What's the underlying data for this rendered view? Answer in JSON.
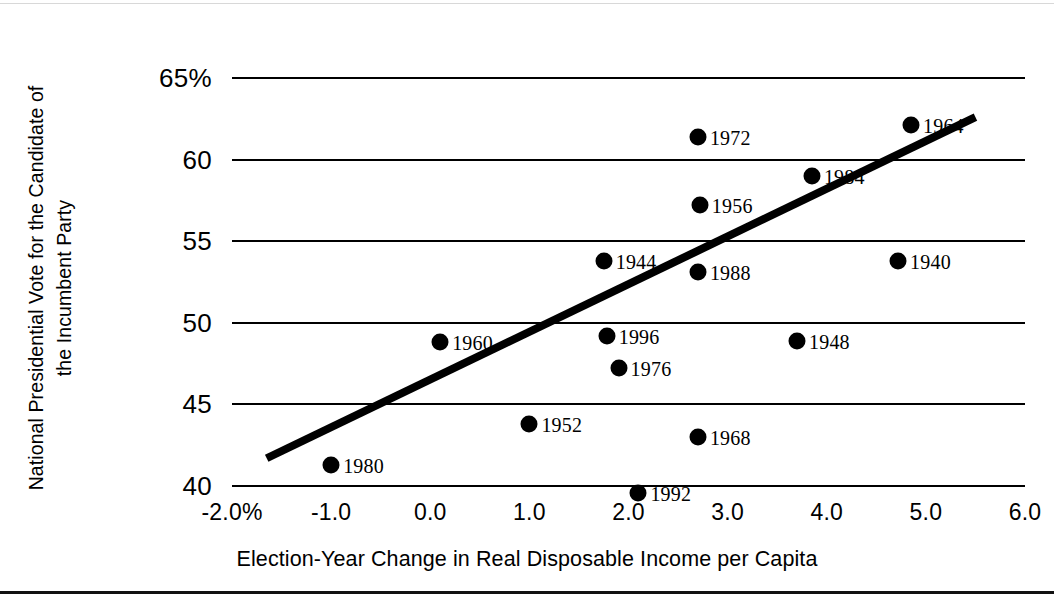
{
  "chart_data": {
    "type": "scatter",
    "title": "",
    "xlabel": "Election-Year Change in Real Disposable Income per Capita",
    "ylabel_lines": [
      "National Presidential Vote for the Candidate of",
      "the Incumbent Party"
    ],
    "xlim": [
      -2.0,
      6.0
    ],
    "ylim": [
      40,
      65
    ],
    "xticks": [
      "-2.0%",
      "-1.0",
      "0.0",
      "1.0",
      "2.0",
      "3.0",
      "4.0",
      "5.0",
      "6.0"
    ],
    "xtick_values": [
      -2.0,
      -1.0,
      0.0,
      1.0,
      2.0,
      3.0,
      4.0,
      5.0,
      6.0
    ],
    "yticks": [
      "65%",
      "60",
      "55",
      "50",
      "45",
      "40"
    ],
    "ytick_values": [
      65,
      60,
      55,
      50,
      45,
      40
    ],
    "grid": "horizontal",
    "legend": "none",
    "marker_color": "#000000",
    "line_color": "#000000",
    "points": [
      {
        "label": "1980",
        "x": -1.0,
        "y": 41.3
      },
      {
        "label": "1960",
        "x": 0.1,
        "y": 48.8
      },
      {
        "label": "1952",
        "x": 1.0,
        "y": 43.8
      },
      {
        "label": "1944",
        "x": 1.75,
        "y": 53.8
      },
      {
        "label": "1996",
        "x": 1.78,
        "y": 49.2
      },
      {
        "label": "1976",
        "x": 1.9,
        "y": 47.2
      },
      {
        "label": "1992",
        "x": 2.1,
        "y": 39.6
      },
      {
        "label": "1972",
        "x": 2.7,
        "y": 61.4
      },
      {
        "label": "1956",
        "x": 2.72,
        "y": 57.2
      },
      {
        "label": "1988",
        "x": 2.7,
        "y": 53.1
      },
      {
        "label": "1968",
        "x": 2.7,
        "y": 43.0
      },
      {
        "label": "1948",
        "x": 3.7,
        "y": 48.9
      },
      {
        "label": "1984",
        "x": 3.85,
        "y": 59.0
      },
      {
        "label": "1940",
        "x": 4.72,
        "y": 53.8
      },
      {
        "label": "1964",
        "x": 4.85,
        "y": 62.1
      }
    ],
    "trendline": {
      "x0": -1.65,
      "y0": 41.7,
      "x1": 5.5,
      "y1": 62.6
    }
  }
}
